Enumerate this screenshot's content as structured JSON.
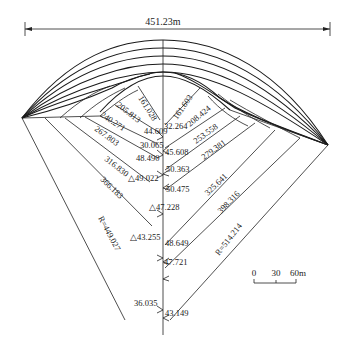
{
  "diagram": {
    "width_label": "451.23m",
    "radius_left": "R=449.027",
    "radius_right": "R=514.214",
    "left_rays": [
      {
        "label": "161.028"
      },
      {
        "label": "205.813"
      },
      {
        "label": "240.271"
      },
      {
        "label": "267.803"
      },
      {
        "label": "316.830"
      },
      {
        "label": "366.183"
      }
    ],
    "right_rays": [
      {
        "label": "161.603"
      },
      {
        "label": "208.424"
      },
      {
        "label": "253.558"
      },
      {
        "label": "279.381"
      },
      {
        "label": "325.641"
      },
      {
        "label": "398.316"
      }
    ],
    "angles": {
      "a1": "44.609",
      "a2": "32.264",
      "a3": "30.065",
      "a4": "45.608",
      "a5": "48.490",
      "a6": "50.363",
      "a7": "△49.022",
      "a8": "50.475",
      "a9": "△47.228",
      "a10": "△43.255",
      "a11": "48.649",
      "a12": "47.721",
      "a13": "36.035",
      "a14": "43.149"
    },
    "scale_bar": {
      "t0": "0",
      "t1": "30",
      "t2": "60m"
    }
  }
}
